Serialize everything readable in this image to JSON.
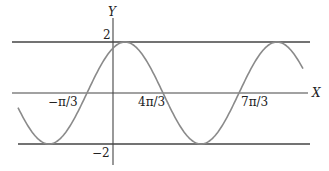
{
  "chart_data": {
    "type": "line",
    "title": "",
    "xlabel": "X",
    "ylabel": "Y",
    "function": "y = 2 sin(3x/5 + π/5)",
    "amplitude": 2,
    "period": "10π/3",
    "y_ticks": [
      "2",
      "-2"
    ],
    "x_tick_labels": [
      "−π/3",
      "4π/3",
      "7π/3"
    ],
    "zero_crossings": [
      "−π/3",
      "4π/3",
      "7π/3"
    ],
    "reference_lines": [
      {
        "label": "y = 2",
        "value": 2
      },
      {
        "label": "y = -2",
        "value": -2
      }
    ],
    "ylim": [
      -2,
      2
    ],
    "grid": false,
    "legend": "none",
    "colors": {
      "axis": "#333333",
      "curve": "#8a8a8a"
    }
  },
  "labels": {
    "y_axis": "Y",
    "x_axis": "X",
    "y_max": "2",
    "y_min": "−2",
    "tick_neg_pi_3": "−π/3",
    "tick_4pi_3": "4π/3",
    "tick_7pi_3": "7π/3"
  }
}
